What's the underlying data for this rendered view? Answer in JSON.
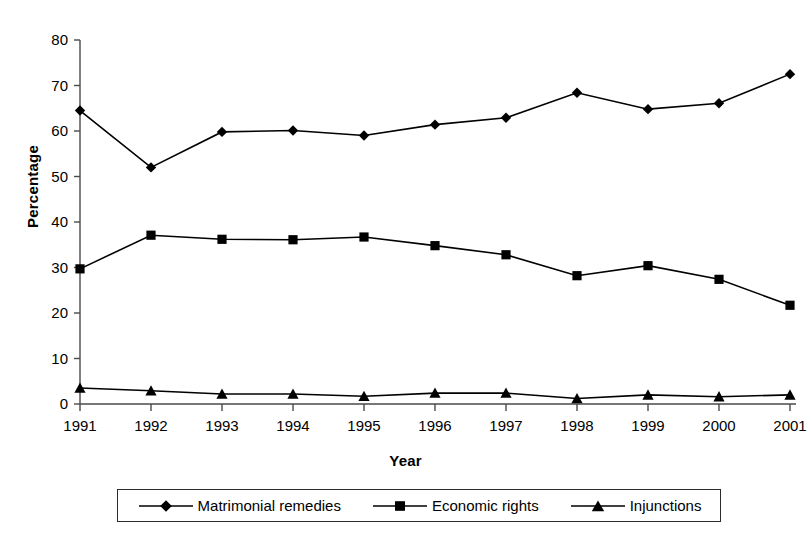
{
  "chart_data": {
    "type": "line",
    "title": "",
    "xlabel": "Year",
    "ylabel": "Percentage",
    "categories": [
      "1991",
      "1992",
      "1993",
      "1994",
      "1995",
      "1996",
      "1997",
      "1998",
      "1999",
      "2000",
      "2001"
    ],
    "x": [
      1991,
      1992,
      1993,
      1994,
      1995,
      1996,
      1997,
      1998,
      1999,
      2000,
      2001
    ],
    "xlim": [
      1991,
      2001
    ],
    "ylim": [
      0,
      80
    ],
    "yticks": [
      0,
      10,
      20,
      30,
      40,
      50,
      60,
      70,
      80
    ],
    "ytick_labels": [
      "0",
      "10",
      "20",
      "30",
      "40",
      "50",
      "60",
      "70",
      "80"
    ],
    "grid": false,
    "legend_position": "bottom",
    "series": [
      {
        "name": "Matrimonial remedies",
        "marker": "diamond",
        "color": "#000000",
        "values": [
          64.5,
          52.0,
          59.8,
          60.1,
          59.0,
          61.4,
          62.9,
          68.4,
          64.8,
          66.1,
          72.5
        ]
      },
      {
        "name": "Economic rights",
        "marker": "square",
        "color": "#000000",
        "values": [
          29.7,
          37.1,
          36.2,
          36.1,
          36.7,
          34.8,
          32.8,
          28.2,
          30.4,
          27.4,
          21.7
        ]
      },
      {
        "name": "Injunctions",
        "marker": "triangle",
        "color": "#000000",
        "values": [
          3.5,
          2.9,
          2.2,
          2.2,
          1.7,
          2.4,
          2.4,
          1.2,
          2.0,
          1.6,
          2.0
        ]
      }
    ]
  },
  "axes": {
    "y_title": "Percentage",
    "x_title": "Year"
  },
  "legend": {
    "items": [
      {
        "label": "Matrimonial remedies",
        "marker": "diamond-marker"
      },
      {
        "label": "Economic rights",
        "marker": "square-marker"
      },
      {
        "label": "Injunctions",
        "marker": "triangle-marker"
      }
    ]
  }
}
